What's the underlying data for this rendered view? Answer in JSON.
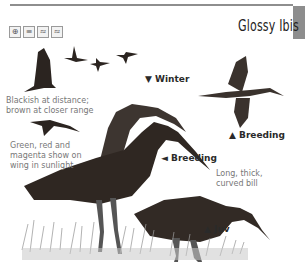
{
  "page": {
    "title": "Glossy Ibis",
    "habitat_icons": [
      {
        "name": "wetland-icon",
        "glyph": "⊕"
      },
      {
        "name": "reedbed-icon",
        "glyph": "≡"
      },
      {
        "name": "coast-icon",
        "glyph": "≈"
      },
      {
        "name": "open-water-icon",
        "glyph": "≈"
      }
    ],
    "annotations": {
      "distance": [
        "Blackish at distance;",
        "brown at closer range"
      ],
      "wing": [
        "Green, red and",
        "magenta show on",
        "wing in sunlight"
      ],
      "bill": [
        "Long, thick,",
        "curved bill"
      ]
    },
    "plumages": {
      "winter": "▼ Winter",
      "breeding_flight": "▲ Breeding",
      "breeding_standing": "◄ Breeding",
      "juv": "▲ Juv"
    }
  },
  "colors": {
    "rule": "#8e8e8e",
    "tab": "#8d8d8d",
    "bird_dark": "#2b2420",
    "bird_mid": "#4a3f38",
    "grass": "#9a9a9a"
  }
}
